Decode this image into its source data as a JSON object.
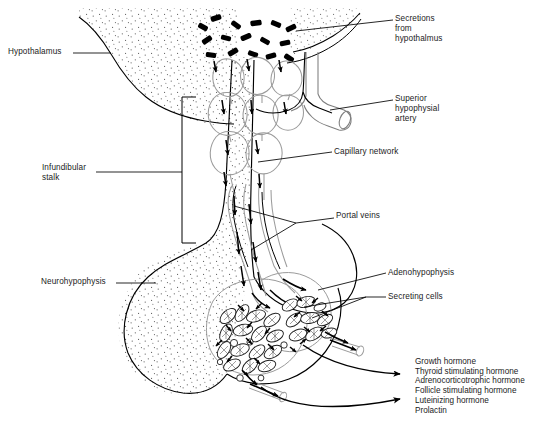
{
  "figure": {
    "background_color": "#ffffff",
    "ink_color": "#000000",
    "vessel_color": "#8a8a8a",
    "width": 549,
    "height": 427
  },
  "labels": {
    "hypothalamus": "Hypothalamus",
    "infundibular_stalk_line1": "Infundibular",
    "infundibular_stalk_line2": "stalk",
    "neurohypophysis": "Neurohypophysis",
    "secretions_line1": "Secretions",
    "secretions_line2": "from",
    "secretions_line3": "hypothalmus",
    "superior_artery_line1": "Superior",
    "superior_artery_line2": "hypophysial",
    "superior_artery_line3": "artery",
    "capillary_network": "Capillary network",
    "portal_veins": "Portal veins",
    "adenohypophysis": "Adenohypophysis",
    "secreting_cells": "Secreting cells"
  },
  "hormones": [
    "Growth hormone",
    "Thyroid stimulating hormone",
    "Adrenocorticotrophic hormone",
    "Follicle stimulating hormone",
    "Luteinizing hormone",
    "Prolactin"
  ],
  "structures": {
    "secretion_granules_count": 16,
    "secreting_cell_count": 26,
    "flow_arrow_count": 34
  }
}
